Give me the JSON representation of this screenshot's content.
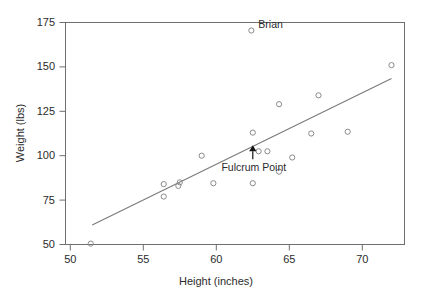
{
  "chart_data": {
    "type": "scatter",
    "title": "",
    "xlabel": "Height (inches)",
    "ylabel": "Weight (lbs)",
    "xlim": [
      50.0,
      72.3
    ],
    "ylim": [
      45.0,
      177.0
    ],
    "xticks": [
      50,
      55,
      60,
      65,
      70
    ],
    "yticks": [
      50,
      75,
      100,
      125,
      150,
      175
    ],
    "xtick_labels": [
      "50",
      "55",
      "60",
      "65",
      "70"
    ],
    "ytick_labels": [
      "50",
      "75",
      "100",
      "125",
      "150",
      "175"
    ],
    "grid": false,
    "legend": false,
    "marker": "open-circle",
    "marker_color": "#8a8a8a",
    "line_color": "#7a7a7a",
    "axis_color": "#6f6f6f",
    "points": [
      {
        "x": 51.4,
        "y": 50.5
      },
      {
        "x": 56.4,
        "y": 84.0
      },
      {
        "x": 56.4,
        "y": 77.0
      },
      {
        "x": 57.5,
        "y": 85.0
      },
      {
        "x": 57.4,
        "y": 83.0
      },
      {
        "x": 59.0,
        "y": 100.0
      },
      {
        "x": 59.8,
        "y": 84.5
      },
      {
        "x": 62.4,
        "y": 170.5,
        "label": "Brian"
      },
      {
        "x": 62.5,
        "y": 113.0
      },
      {
        "x": 62.5,
        "y": 84.5
      },
      {
        "x": 62.9,
        "y": 102.5
      },
      {
        "x": 63.5,
        "y": 102.5
      },
      {
        "x": 64.3,
        "y": 129.0
      },
      {
        "x": 64.3,
        "y": 91.0
      },
      {
        "x": 65.2,
        "y": 99.0
      },
      {
        "x": 66.5,
        "y": 112.5
      },
      {
        "x": 67.0,
        "y": 134.0
      },
      {
        "x": 69.0,
        "y": 113.5
      },
      {
        "x": 72.0,
        "y": 151.0
      }
    ],
    "trend_line": {
      "x_start": 51.5,
      "y_start": 61.0,
      "x_end": 72.0,
      "y_end": 143.5
    },
    "fulcrum_point": {
      "x": 62.5,
      "y": 103.0,
      "label": "Fulcrum Point",
      "marker": "filled-triangle-with-stem"
    },
    "annotations": [
      {
        "text": "Brian",
        "x": 62.4,
        "y": 170.5
      },
      {
        "text": "Fulcrum Point",
        "x": 62.5,
        "y": 103.0
      }
    ]
  },
  "axes": {
    "x_axis_title": "Height (inches)",
    "y_axis_title": "Weight (lbs)"
  }
}
